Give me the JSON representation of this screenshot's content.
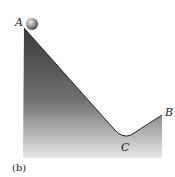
{
  "figure": {
    "caption": "(b)",
    "points": {
      "A": "A",
      "B": "B",
      "C": "C"
    },
    "objects": [
      "ball-at-A",
      "track-A-C-B"
    ]
  }
}
